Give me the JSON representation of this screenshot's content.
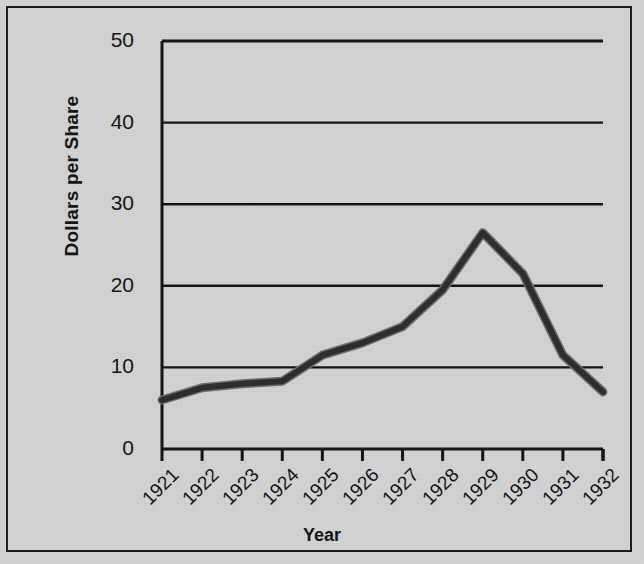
{
  "chart_data": {
    "type": "line",
    "title": "",
    "xlabel": "Year",
    "ylabel": "Dollars per Share",
    "categories": [
      "1921",
      "1922",
      "1923",
      "1924",
      "1925",
      "1926",
      "1927",
      "1928",
      "1929",
      "1930",
      "1931",
      "1932"
    ],
    "values": [
      6,
      7.5,
      8,
      8.3,
      11.5,
      13,
      15,
      19.5,
      26.5,
      21.5,
      11.5,
      7
    ],
    "series": [
      {
        "name": "Dollars per Share",
        "values": [
          6,
          7.5,
          8,
          8.3,
          11.5,
          13,
          15,
          19.5,
          26.5,
          21.5,
          11.5,
          7
        ]
      }
    ],
    "ylim": [
      0,
      50
    ],
    "yticks": [
      0,
      10,
      20,
      30,
      40,
      50
    ],
    "ytick_labels": [
      "0",
      "10",
      "20",
      "30",
      "40",
      "50"
    ],
    "xtick_labels": [
      "1921",
      "1922",
      "1923",
      "1924",
      "1925",
      "1926",
      "1927",
      "1928",
      "1929",
      "1930",
      "1931",
      "1932"
    ],
    "grid": "horizontal",
    "legend": "none",
    "line_color": "#3a3a3a",
    "axis_color": "#111111",
    "background_color": "#d4d4d4",
    "xtick_rotation": -45
  },
  "axes": {
    "y_axis_title": "Dollars per Share",
    "x_axis_title": "Year"
  }
}
